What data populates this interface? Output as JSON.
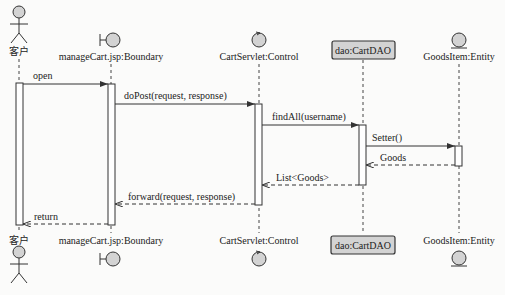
{
  "diagram": {
    "type": "uml-sequence",
    "participants": [
      {
        "id": "customer",
        "label": "客户",
        "stereotype": "actor",
        "x": 19
      },
      {
        "id": "boundary",
        "label": "manageCart.jsp:Boundary",
        "stereotype": "boundary",
        "x": 111
      },
      {
        "id": "control",
        "label": "CartServlet:Control",
        "stereotype": "control",
        "x": 259
      },
      {
        "id": "dao",
        "label": "dao:CartDAO",
        "stereotype": "class-box",
        "x": 363
      },
      {
        "id": "entity",
        "label": "GoodsItem:Entity",
        "stereotype": "entity",
        "x": 459
      }
    ],
    "messages": [
      {
        "from": "customer",
        "to": "boundary",
        "label": "open",
        "kind": "sync",
        "y": 83
      },
      {
        "from": "boundary",
        "to": "control",
        "label": "doPost(request, response)",
        "kind": "sync",
        "y": 104
      },
      {
        "from": "control",
        "to": "dao",
        "label": "findAll(username)",
        "kind": "sync",
        "y": 125
      },
      {
        "from": "dao",
        "to": "entity",
        "label": "Setter()",
        "kind": "sync",
        "y": 146
      },
      {
        "from": "entity",
        "to": "dao",
        "label": "Goods",
        "kind": "return",
        "y": 165
      },
      {
        "from": "dao",
        "to": "control",
        "label": "List<Goods>",
        "kind": "return",
        "y": 185
      },
      {
        "from": "control",
        "to": "boundary",
        "label": "forward(request, response)",
        "kind": "return",
        "y": 204
      },
      {
        "from": "boundary",
        "to": "customer",
        "label": "return",
        "kind": "return",
        "y": 224
      }
    ]
  },
  "labels": {
    "customer": "客户",
    "boundary": "manageCart.jsp:Boundary",
    "control": "CartServlet:Control",
    "dao": "dao:CartDAO",
    "entity": "GoodsItem:Entity",
    "msg_open": "open",
    "msg_dopost": "doPost(request, response)",
    "msg_findall": "findAll(username)",
    "msg_setter": "Setter()",
    "msg_goods": "Goods",
    "msg_list": "List<Goods>",
    "msg_forward": "forward(request, response)",
    "msg_return": "return"
  },
  "colors": {
    "ink": "#333333",
    "fill": "#d3d3d3",
    "background": "#fbfbfa"
  }
}
